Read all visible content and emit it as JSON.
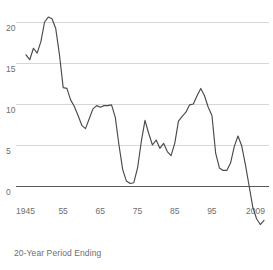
{
  "chart_data": {
    "type": "line",
    "title": "",
    "subtitle": "",
    "xlabel": "20-Year Period Ending",
    "ylabel": "",
    "grid": true,
    "legend": false,
    "xlim": [
      1945,
      2009
    ],
    "ylim": [
      -7,
      21.5
    ],
    "y_ticks": [
      20,
      15,
      10,
      5,
      0,
      -5
    ],
    "y_tick_labels": [
      "20",
      "15",
      "10",
      "5",
      "0",
      "-5"
    ],
    "x_ticks": [
      1945,
      1955,
      1965,
      1975,
      1985,
      1995,
      2009
    ],
    "x_tick_labels": [
      "1945",
      "55",
      "65",
      "75",
      "85",
      "95",
      "2009"
    ],
    "series": [
      {
        "name": "20-Year Annualized Return",
        "x": [
          1945,
          1946,
          1947,
          1948,
          1949,
          1950,
          1951,
          1952,
          1953,
          1954,
          1955,
          1956,
          1957,
          1958,
          1959,
          1960,
          1961,
          1962,
          1963,
          1964,
          1965,
          1966,
          1967,
          1968,
          1969,
          1970,
          1971,
          1972,
          1973,
          1974,
          1975,
          1976,
          1977,
          1978,
          1979,
          1980,
          1981,
          1982,
          1983,
          1984,
          1985,
          1986,
          1987,
          1988,
          1989,
          1990,
          1991,
          1992,
          1993,
          1994,
          1995,
          1996,
          1997,
          1998,
          1999,
          2000,
          2001,
          2002,
          2003,
          2004,
          2005,
          2006,
          2007,
          2008,
          2009
        ],
        "values": [
          16.0,
          15.4,
          16.8,
          16.2,
          17.6,
          20.0,
          20.6,
          20.4,
          19.2,
          16.0,
          12.0,
          11.9,
          10.5,
          9.7,
          8.6,
          7.4,
          7.0,
          8.2,
          9.4,
          9.8,
          9.6,
          9.8,
          9.8,
          9.9,
          8.4,
          5.0,
          2.0,
          0.6,
          0.3,
          0.4,
          2.2,
          5.4,
          8.0,
          6.4,
          5.0,
          5.6,
          4.6,
          5.2,
          4.2,
          3.7,
          5.2,
          7.9,
          8.5,
          9.0,
          9.9,
          10.0,
          11.0,
          11.9,
          11.0,
          9.6,
          8.6,
          4.0,
          2.2,
          1.9,
          1.9,
          2.8,
          4.8,
          6.1,
          4.9,
          2.6,
          0.0,
          -2.6,
          -4.0,
          -4.7,
          -4.2
        ]
      }
    ]
  },
  "axis": {
    "x_title": "20-Year Period Ending"
  }
}
